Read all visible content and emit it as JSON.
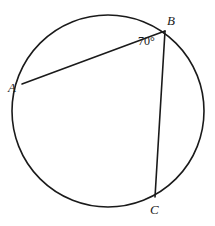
{
  "figure": {
    "type": "circle-geometry-diagram",
    "background_color": "#ffffff",
    "stroke_color": "#1a1a1a",
    "circle": {
      "name": "circle",
      "cx": 108,
      "cy": 111,
      "r": 96,
      "stroke_width": 1.6,
      "fill": "none"
    },
    "points": [
      {
        "id": "A",
        "label": "A",
        "x": 22,
        "y": 84
      },
      {
        "id": "B",
        "label": "B",
        "x": 165,
        "y": 31
      },
      {
        "id": "C",
        "label": "C",
        "x": 155,
        "y": 197
      }
    ],
    "chords": [
      {
        "name": "chord-ab",
        "from": "A",
        "to": "B",
        "x1": 22,
        "y1": 84,
        "x2": 165,
        "y2": 31,
        "stroke_width": 1.6
      },
      {
        "name": "chord-bc",
        "from": "B",
        "to": "C",
        "x1": 165,
        "y1": 31,
        "x2": 155,
        "y2": 197,
        "stroke_width": 1.6
      }
    ],
    "angles": [
      {
        "name": "angle-abc",
        "vertex": "B",
        "value": 70,
        "unit": "degrees",
        "label": "70°"
      }
    ]
  },
  "labels": {
    "point_a": "A",
    "point_b": "B",
    "point_c": "C",
    "angle_abc": "70°"
  }
}
